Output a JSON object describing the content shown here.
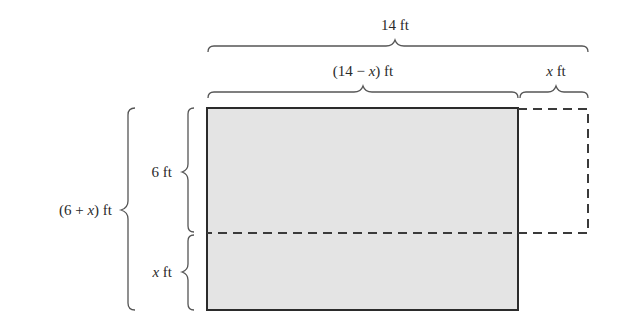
{
  "diagram": {
    "labels": {
      "total_width": {
        "value": "14",
        "unit": " ft"
      },
      "reduced_width": {
        "prefix": "(14 − ",
        "var": "x",
        "suffix": ") ft"
      },
      "extension_width": {
        "var": "x",
        "unit": " ft"
      },
      "original_height": {
        "value": "6",
        "unit": " ft"
      },
      "added_height": {
        "var": "x",
        "unit": " ft"
      },
      "total_height": {
        "prefix": "(6 + ",
        "var": "x",
        "suffix": ") ft"
      }
    },
    "colors": {
      "fill": "#e4e4e4",
      "stroke": "#2b2b2b",
      "brace": "#555555",
      "dash": "#3a3a3a"
    }
  }
}
